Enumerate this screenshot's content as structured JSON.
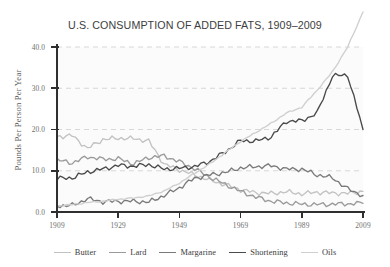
{
  "chart_data": {
    "type": "line",
    "title": "U.S. CONSUMPTION OF ADDED FATS, 1909–2009",
    "xlabel": "",
    "ylabel": "Pounds Per Person Per Year",
    "xlim": [
      1909,
      2009
    ],
    "ylim": [
      0.0,
      40.0
    ],
    "xticks": [
      1909,
      1929,
      1949,
      1969,
      1989,
      2009
    ],
    "xtick_labels": [
      "1909",
      "1929",
      "1949",
      "1969",
      "1989",
      "2009"
    ],
    "yticks": [
      0.0,
      10.0,
      20.0,
      30.0,
      40.0
    ],
    "ytick_labels": [
      "0.0",
      "10.0",
      "20.0",
      "30.0",
      "40.0"
    ],
    "grid": "horizontal-dashed",
    "legend_position": "bottom",
    "x": [
      1909,
      1914,
      1919,
      1924,
      1929,
      1934,
      1939,
      1944,
      1949,
      1954,
      1959,
      1964,
      1969,
      1974,
      1979,
      1984,
      1989,
      1994,
      1999,
      2004,
      2009
    ],
    "series": [
      {
        "name": "Butter",
        "color": "#c2c2c2",
        "values": [
          18.3,
          18.5,
          15.4,
          17.6,
          17.9,
          17.8,
          17.2,
          11.6,
          10.2,
          9.0,
          7.7,
          6.6,
          5.4,
          4.7,
          4.5,
          4.9,
          4.4,
          4.8,
          4.6,
          4.5,
          5.0
        ]
      },
      {
        "name": "Lard",
        "color": "#9a9a9a",
        "values": [
          12.6,
          11.9,
          13.4,
          12.8,
          12.9,
          11.7,
          13.2,
          13.6,
          12.2,
          10.5,
          8.4,
          6.7,
          5.0,
          3.6,
          2.6,
          2.2,
          1.9,
          1.8,
          1.9,
          2.0,
          2.1
        ]
      },
      {
        "name": "Margarine",
        "color": "#7a7a7a",
        "values": [
          1.5,
          1.6,
          3.2,
          2.5,
          2.6,
          2.6,
          2.4,
          4.0,
          5.9,
          8.2,
          9.0,
          9.6,
          10.7,
          11.0,
          11.2,
          10.4,
          10.4,
          9.0,
          8.3,
          5.6,
          4.0
        ]
      },
      {
        "name": "Shortening",
        "color": "#4a4a4a",
        "values": [
          8.1,
          8.3,
          9.7,
          10.4,
          11.3,
          11.1,
          11.5,
          10.4,
          10.6,
          11.0,
          12.3,
          14.6,
          17.3,
          17.2,
          18.2,
          22.0,
          22.1,
          24.0,
          33.0,
          33.2,
          20.0
        ]
      },
      {
        "name": "Oils",
        "color": "#cfcfcf",
        "values": [
          1.5,
          1.8,
          2.3,
          2.6,
          3.1,
          3.4,
          3.9,
          5.1,
          7.0,
          9.4,
          11.7,
          14.4,
          17.1,
          19.3,
          21.5,
          24.0,
          25.4,
          29.5,
          34.0,
          40.0,
          48.5
        ]
      }
    ]
  },
  "legend": {
    "items": [
      {
        "label": "Butter"
      },
      {
        "label": "Lard"
      },
      {
        "label": "Margarine"
      },
      {
        "label": "Shortening"
      },
      {
        "label": "Oils"
      }
    ]
  }
}
